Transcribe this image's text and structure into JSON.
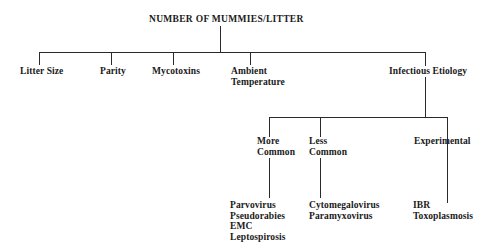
{
  "title": "NUMBER OF MUMMIES/LITTER",
  "factors": [
    {
      "label": "Litter Size"
    },
    {
      "label": "Parity"
    },
    {
      "label": "Mycotoxins"
    },
    {
      "label_lines": [
        "Ambient",
        "Temperature"
      ]
    },
    {
      "label": "Infectious Etiology"
    }
  ],
  "infectious": {
    "categories": [
      {
        "label_lines": [
          "More",
          "Common"
        ],
        "agents": [
          "Parvovirus",
          "Pseudorabies",
          "EMC",
          "Leptospirosis"
        ]
      },
      {
        "label_lines": [
          "Less",
          "Common"
        ],
        "agents": [
          "Cytomegalovirus",
          "Paramyxovirus"
        ]
      },
      {
        "label": "Experimental",
        "agents": [
          "IBR",
          "Toxoplasmosis"
        ]
      }
    ]
  }
}
